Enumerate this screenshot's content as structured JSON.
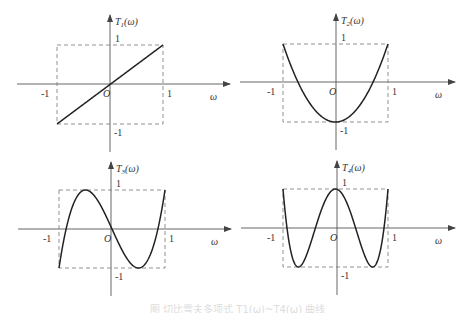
{
  "figure": {
    "caption": "图 切比雪夫多项式 T1(ω)~T4(ω) 曲线",
    "axis_x_label": "ω",
    "origin_label": "O",
    "tick_pos": "1",
    "tick_neg": "-1"
  },
  "panels": [
    {
      "id": "T1",
      "label_main": "T",
      "label_sub": "1",
      "label_arg": "(ω)",
      "formula": "ω"
    },
    {
      "id": "T2",
      "label_main": "T",
      "label_sub": "2",
      "label_arg": "(ω)",
      "formula": "2ω²-1"
    },
    {
      "id": "T3",
      "label_main": "T",
      "label_sub": "3",
      "label_arg": "(ω)",
      "formula": "4ω³-3ω"
    },
    {
      "id": "T4",
      "label_main": "T",
      "label_sub": "4",
      "label_arg": "(ω)",
      "formula": "8ω⁴-8ω²+1"
    }
  ],
  "chart_data": [
    {
      "type": "line",
      "title": "T1(ω)",
      "xlabel": "ω",
      "ylabel": "T1(ω)",
      "xlim": [
        -1,
        1
      ],
      "ylim": [
        -1,
        1
      ],
      "x": [
        -1,
        -0.5,
        0,
        0.5,
        1
      ],
      "series": [
        {
          "name": "T1(ω)",
          "values": [
            -1,
            -0.5,
            0,
            0.5,
            1
          ]
        }
      ],
      "annotations": [
        "dashed box [-1,1]×[-1,1]",
        "O at origin"
      ]
    },
    {
      "type": "line",
      "title": "T2(ω)",
      "xlabel": "ω",
      "ylabel": "T2(ω)",
      "xlim": [
        -1,
        1
      ],
      "ylim": [
        -1,
        1
      ],
      "x": [
        -1,
        -0.75,
        -0.5,
        -0.25,
        0,
        0.25,
        0.5,
        0.75,
        1
      ],
      "series": [
        {
          "name": "T2(ω)",
          "values": [
            1,
            0.125,
            -0.5,
            -0.875,
            -1,
            -0.875,
            -0.5,
            0.125,
            1
          ]
        }
      ],
      "annotations": [
        "dashed box [-1,1]×[-1,1]",
        "O at origin"
      ]
    },
    {
      "type": "line",
      "title": "T3(ω)",
      "xlabel": "ω",
      "ylabel": "T3(ω)",
      "xlim": [
        -1,
        1
      ],
      "ylim": [
        -1,
        1
      ],
      "x": [
        -1,
        -0.75,
        -0.5,
        -0.25,
        0,
        0.25,
        0.5,
        0.75,
        1
      ],
      "series": [
        {
          "name": "T3(ω)",
          "values": [
            -1,
            0.5625,
            1,
            0.6875,
            0,
            -0.6875,
            -1,
            -0.5625,
            1
          ]
        }
      ],
      "annotations": [
        "dashed box [-1,1]×[-1,1]",
        "O at origin"
      ]
    },
    {
      "type": "line",
      "title": "T4(ω)",
      "xlabel": "ω",
      "ylabel": "T4(ω)",
      "xlim": [
        -1,
        1
      ],
      "ylim": [
        -1,
        1
      ],
      "x": [
        -1,
        -0.75,
        -0.5,
        -0.25,
        0,
        0.25,
        0.5,
        0.75,
        1
      ],
      "series": [
        {
          "name": "T4(ω)",
          "values": [
            1,
            -0.96875,
            -0.5,
            0.53125,
            1,
            0.53125,
            -0.5,
            -0.96875,
            1
          ]
        }
      ],
      "annotations": [
        "dashed box [-1,1]×[-1,1]",
        "O at origin"
      ]
    }
  ]
}
